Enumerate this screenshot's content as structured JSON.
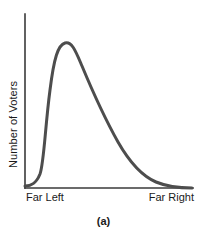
{
  "figure": {
    "caption": "(a)",
    "background_color": "#ffffff"
  },
  "chart_data": {
    "type": "line",
    "title": "",
    "subtitle": "",
    "xlabel": "",
    "ylabel": "Number of Voters",
    "curve_color": "#4d4d4d",
    "curve_width": 3,
    "axis_color": "#3a3a3a",
    "axis_width": 1.5,
    "grid": false,
    "legend": false,
    "xlim": [
      0,
      100
    ],
    "ylim": [
      0,
      100
    ],
    "xticks": [
      0,
      100
    ],
    "xticklabels": [
      "Far Left",
      "Far Right"
    ],
    "yticks": [],
    "yticklabels": [],
    "x": [
      0,
      4,
      8,
      12,
      16,
      20,
      23,
      26,
      30,
      34,
      38,
      42,
      46,
      50,
      54,
      58,
      62,
      66,
      70,
      74,
      78,
      82,
      86,
      90,
      94,
      100
    ],
    "y": [
      2,
      3,
      5,
      10,
      30,
      72,
      86,
      88,
      84,
      77,
      69,
      61,
      53,
      45,
      38,
      32,
      26,
      21,
      16,
      12,
      9,
      6,
      4,
      3,
      2,
      1
    ],
    "peak": {
      "x": 24,
      "y": 88
    },
    "series": [
      {
        "name": "Number of Voters",
        "x": [
          0,
          4,
          8,
          12,
          16,
          20,
          23,
          26,
          30,
          34,
          38,
          42,
          46,
          50,
          54,
          58,
          62,
          66,
          70,
          74,
          78,
          82,
          86,
          90,
          94,
          100
        ],
        "values": [
          2,
          3,
          5,
          10,
          30,
          72,
          86,
          88,
          84,
          77,
          69,
          61,
          53,
          45,
          38,
          32,
          26,
          21,
          16,
          12,
          9,
          6,
          4,
          3,
          2,
          1
        ]
      }
    ],
    "path_d": "M 25 186 C 31 186, 36 184, 40 174 C 44 163, 45 128, 50 90 C 54 58, 58 45, 65 43 C 72 41, 76 52, 82 66 C 92 90, 104 117, 118 142 C 130 163, 142 176, 156 182 C 168 187, 182 188, 192 188"
  },
  "axes": {
    "x_axis_left_label": "Far Left",
    "x_axis_right_label": "Far Right",
    "y_axis_label": "Number of Voters"
  }
}
